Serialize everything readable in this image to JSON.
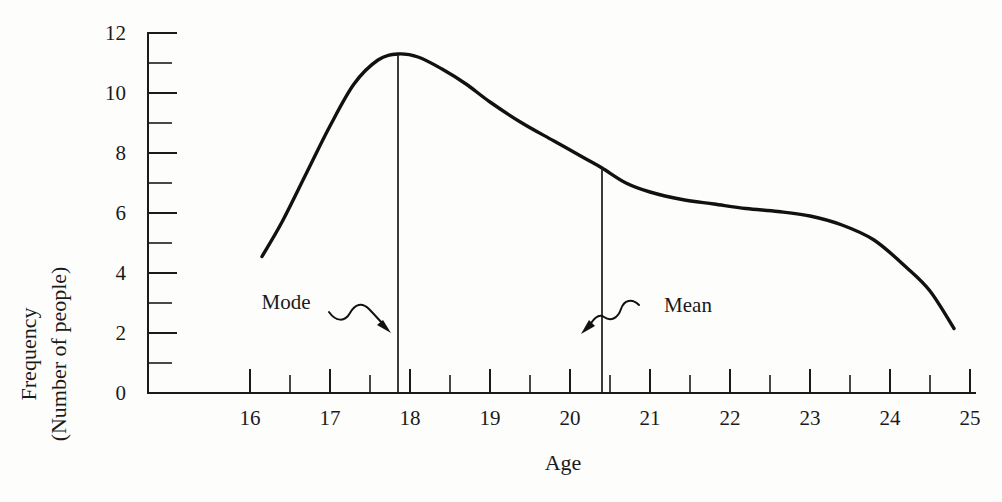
{
  "chart_data": {
    "type": "line",
    "title": "",
    "xlabel": "Age",
    "ylabel": "Frequency\n(Number of people)",
    "ylabel_line1": "Frequency",
    "ylabel_line2": "(Number of people)",
    "xlim": [
      15.2,
      25.7
    ],
    "ylim": [
      0,
      12
    ],
    "grid": false,
    "legend": "none",
    "x_ticks": [
      16,
      17,
      18,
      19,
      20,
      21,
      22,
      23,
      24,
      25
    ],
    "x_tick_labels": [
      "16",
      "17",
      "18",
      "19",
      "20",
      "21",
      "22",
      "23",
      "24",
      "25"
    ],
    "x_minor_ticks": [
      16.5,
      17.5,
      18.5,
      19.5,
      20.5,
      21.5,
      22.5,
      23.5,
      24.5
    ],
    "y_ticks": [
      0,
      2,
      4,
      6,
      8,
      10,
      12
    ],
    "y_tick_labels": [
      "0",
      "2",
      "4",
      "6",
      "8",
      "10",
      "12"
    ],
    "y_minor_ticks": [
      1,
      3,
      5,
      7,
      9,
      11
    ],
    "series": [
      {
        "name": "Age distribution",
        "color": "#111111",
        "x": [
          16.15,
          16.4,
          16.7,
          17.0,
          17.3,
          17.6,
          17.85,
          18.1,
          18.4,
          18.7,
          19.0,
          19.4,
          19.8,
          20.2,
          20.4,
          20.7,
          21.0,
          21.4,
          21.8,
          22.2,
          22.6,
          23.0,
          23.4,
          23.8,
          24.2,
          24.5,
          24.8
        ],
        "y": [
          4.55,
          5.7,
          7.3,
          8.9,
          10.3,
          11.1,
          11.3,
          11.2,
          10.8,
          10.3,
          9.7,
          9.0,
          8.4,
          7.8,
          7.5,
          7.0,
          6.7,
          6.45,
          6.3,
          6.15,
          6.05,
          5.9,
          5.6,
          5.1,
          4.2,
          3.4,
          2.15
        ]
      }
    ],
    "annotations": [
      {
        "name": "mode",
        "label": "Mode",
        "x": 17.85,
        "y_top": 11.3,
        "label_x": 17.05,
        "label_y": 3.35,
        "arrow": "squiggly-right-down"
      },
      {
        "name": "mean",
        "label": "Mean",
        "x": 20.4,
        "y_top": 7.5,
        "label_x": 21.2,
        "label_y": 2.95,
        "arrow": "squiggly-left-down"
      }
    ]
  }
}
